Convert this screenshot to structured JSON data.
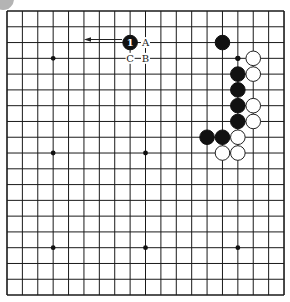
{
  "board": {
    "size": 19,
    "origin_x": 7,
    "origin_y": 11,
    "spacing_x": 15.39,
    "spacing_y": 15.78,
    "line_color": "#1a1a1a",
    "background": "#ffffff",
    "star_points": [
      [
        3,
        3
      ],
      [
        9,
        3
      ],
      [
        15,
        3
      ],
      [
        3,
        9
      ],
      [
        9,
        9
      ],
      [
        15,
        9
      ],
      [
        3,
        15
      ],
      [
        9,
        15
      ],
      [
        15,
        15
      ]
    ]
  },
  "stones": {
    "black": [
      {
        "col": 8,
        "row": 2,
        "number": "1"
      },
      {
        "col": 14,
        "row": 2
      },
      {
        "col": 15,
        "row": 4
      },
      {
        "col": 15,
        "row": 5
      },
      {
        "col": 15,
        "row": 6
      },
      {
        "col": 15,
        "row": 7
      },
      {
        "col": 13,
        "row": 8
      },
      {
        "col": 14,
        "row": 8
      }
    ],
    "white": [
      {
        "col": 16,
        "row": 3
      },
      {
        "col": 16,
        "row": 4
      },
      {
        "col": 16,
        "row": 6
      },
      {
        "col": 16,
        "row": 7
      },
      {
        "col": 15,
        "row": 8
      },
      {
        "col": 14,
        "row": 9
      },
      {
        "col": 15,
        "row": 9
      }
    ]
  },
  "markers": [
    {
      "col": 15,
      "row": 3,
      "type": "small-dot"
    }
  ],
  "labels": [
    {
      "col": 9,
      "row": 2,
      "text": "A"
    },
    {
      "col": 9,
      "row": 3,
      "text": "B"
    },
    {
      "col": 8,
      "row": 3,
      "text": "C"
    }
  ],
  "arrow": {
    "from": {
      "x": 122,
      "y": 39.5
    },
    "to": {
      "x": 84,
      "y": 39.5
    },
    "direction": "left"
  },
  "corner_decoration": {
    "shape": "circle",
    "color": "#b4b4b4"
  }
}
